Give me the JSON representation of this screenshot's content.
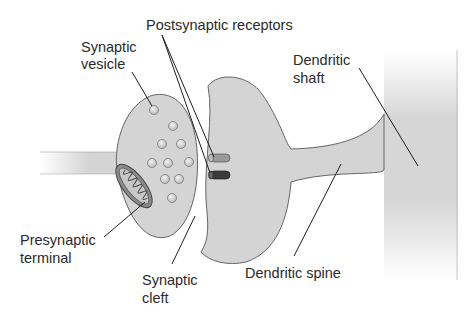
{
  "diagram": {
    "labels": {
      "postsynaptic_receptors": "Postsynaptic receptors",
      "synaptic_vesicle_1": "Synaptic",
      "synaptic_vesicle_2": "vesicle",
      "dendritic_shaft_1": "Dendritic",
      "dendritic_shaft_2": "shaft",
      "presynaptic_terminal_1": "Presynaptic",
      "presynaptic_terminal_2": "terminal",
      "synaptic_cleft_1": "Synaptic",
      "synaptic_cleft_2": "cleft",
      "dendritic_spine": "Dendritic spine"
    },
    "colors": {
      "membrane_fill": "#d4d4d4",
      "outline": "#555555",
      "receptor_light": "#9a9a9a",
      "receptor_dark": "#3a3a3a",
      "leader_line": "#1e1e1e"
    }
  }
}
